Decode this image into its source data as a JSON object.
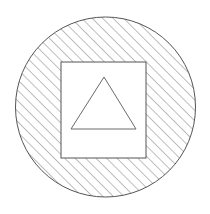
{
  "figure": {
    "type": "geometric-line-diagram",
    "canvas": {
      "width": 210,
      "height": 214,
      "background": "#ffffff"
    },
    "stroke_color": "#555555",
    "hatch_color": "#7d7d7d",
    "fill_color": "#ffffff",
    "shapes": [
      {
        "name": "circle",
        "kind": "circle",
        "cx": 105.5,
        "cy": 107,
        "r": 90,
        "fill": "hatch-45",
        "stroke": "#555555",
        "stroke_width": 1
      },
      {
        "name": "square",
        "kind": "rect",
        "x": 61,
        "y": 62,
        "width": 85,
        "height": 96,
        "fill": "#ffffff",
        "stroke": "#555555",
        "stroke_width": 1
      },
      {
        "name": "triangle",
        "kind": "polygon",
        "points": "104,77 136,129 71,129",
        "apex": {
          "x": 104,
          "y": 77
        },
        "base_left": {
          "x": 71,
          "y": 129
        },
        "base_right": {
          "x": 136,
          "y": 129
        },
        "fill": "#ffffff",
        "stroke": "#6a6a6a",
        "stroke_width": 1
      }
    ],
    "hatch": {
      "angle_degrees": 45,
      "direction": "lower-left to upper-right",
      "spacing_px": 7.4,
      "line_width": 1,
      "color": "#7d7d7d"
    }
  }
}
